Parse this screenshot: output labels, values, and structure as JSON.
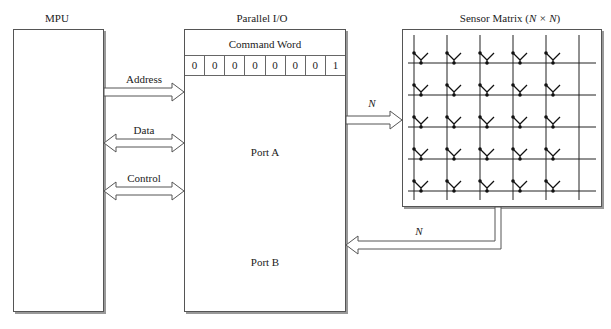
{
  "mpu": {
    "title": "MPU"
  },
  "parallel_io": {
    "title": "Parallel I/O",
    "command_word_label": "Command Word",
    "command_bits": [
      "0",
      "0",
      "0",
      "0",
      "0",
      "0",
      "0",
      "1"
    ],
    "port_a_label": "Port A",
    "port_b_label": "Port B"
  },
  "sensor_matrix": {
    "title_prefix": "Sensor Matrix (",
    "title_math": "N × N",
    "title_suffix": ")",
    "rows": 5,
    "cols": 5
  },
  "buses": {
    "address": "Address",
    "data": "Data",
    "control": "Control",
    "port_a_out": "N",
    "port_b_in": "N"
  }
}
